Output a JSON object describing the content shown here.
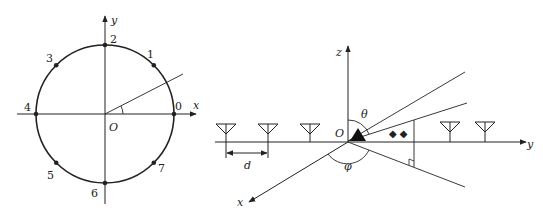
{
  "left_diagram": {
    "title": "Uniform circular array",
    "axis_x_label": "x",
    "axis_y_label": "y",
    "origin_label": "O",
    "elements": [
      {
        "index": "0",
        "angle_deg": 0
      },
      {
        "index": "1",
        "angle_deg": 45
      },
      {
        "index": "2",
        "angle_deg": 90
      },
      {
        "index": "3",
        "angle_deg": 135
      },
      {
        "index": "4",
        "angle_deg": 180
      },
      {
        "index": "5",
        "angle_deg": 225
      },
      {
        "index": "6",
        "angle_deg": 270
      },
      {
        "index": "7",
        "angle_deg": 315
      }
    ]
  },
  "right_diagram": {
    "title": "Uniform linear array with incident signal",
    "axis_z_label": "z",
    "axis_y_label": "y",
    "axis_x_label": "x",
    "origin_label": "O",
    "elevation_angle_label": "θ",
    "azimuth_angle_label": "φ",
    "spacing_label": "d",
    "antenna_count": 5,
    "dots_marker": "◆ ◆"
  },
  "colors": {
    "stroke": "#222222",
    "background": "#ffffff"
  }
}
